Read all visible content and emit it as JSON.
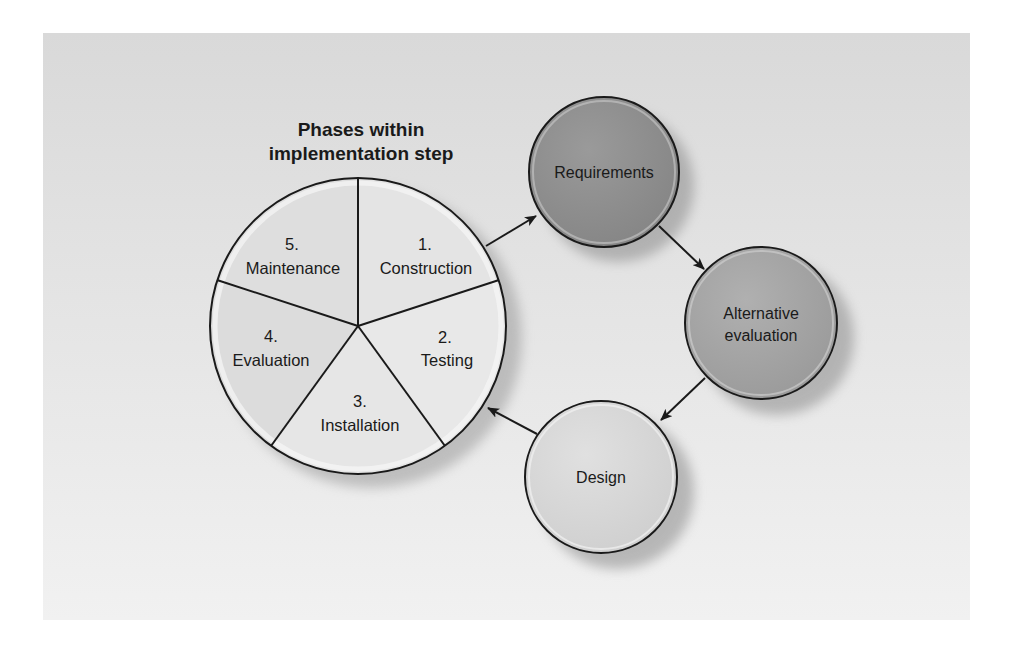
{
  "diagram": {
    "title_line1": "Phases within",
    "title_line2": "implementation step",
    "pie": {
      "slices": [
        {
          "number": "1.",
          "label": "Construction"
        },
        {
          "number": "2.",
          "label": "Testing"
        },
        {
          "number": "3.",
          "label": "Installation"
        },
        {
          "number": "4.",
          "label": "Evaluation"
        },
        {
          "number": "5.",
          "label": "Maintenance"
        }
      ]
    },
    "nodes": [
      {
        "label": "Requirements",
        "color": "#8f8f8f"
      },
      {
        "label_line1": "Alternative",
        "label_line2": "evaluation",
        "color": "#a6a6a6"
      },
      {
        "label": "Design",
        "color": "#d8d8d8"
      }
    ],
    "flow": [
      "Implementation",
      "Requirements",
      "Alternative evaluation",
      "Design",
      "Implementation"
    ],
    "colors": {
      "panel_top": "#d9d9d9",
      "panel_bottom": "#f1f1f1",
      "pie_fill": "#e2e2e2",
      "stroke": "#1a1a1a"
    }
  }
}
